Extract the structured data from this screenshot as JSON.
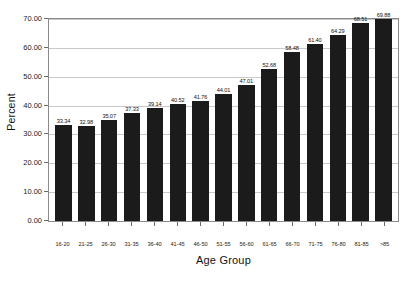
{
  "chart_data": {
    "type": "bar",
    "title": "",
    "xlabel": "Age Group",
    "ylabel": "Percent",
    "categories": [
      "16-20",
      "21-25",
      "26-30",
      "31-35",
      "36-40",
      "41-45",
      "46-50",
      "51-55",
      "56-60",
      "61-65",
      "66-70",
      "71-75",
      "76-80",
      "81-85",
      ">85"
    ],
    "values": [
      33.34,
      32.98,
      35.07,
      37.33,
      39.14,
      40.52,
      41.76,
      44.01,
      47.01,
      52.68,
      58.48,
      61.4,
      64.29,
      68.51,
      69.88
    ],
    "value_labels": [
      "33.34",
      "32.98",
      "35.07",
      "37.33",
      "39.14",
      "40.52",
      "41.76",
      "44.01",
      "47.01",
      "52.68",
      "58.48",
      "61.40",
      "64.29",
      "68.51",
      "69.88"
    ],
    "ylim": [
      0,
      70
    ],
    "ytick_values": [
      0,
      10,
      20,
      30,
      40,
      50,
      60,
      70
    ],
    "ytick_labels": [
      "0.00",
      "10.00",
      "20.00",
      "30.00",
      "40.00",
      "50.00",
      "60.00",
      "70.00"
    ],
    "grid": true,
    "legend": null,
    "bar_color": "#1b1b1b",
    "grid_color": "#c8c8c8",
    "axis_color": "#8a8a8a",
    "background": "#ffffff"
  }
}
